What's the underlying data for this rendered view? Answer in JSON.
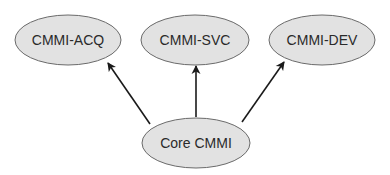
{
  "diagram": {
    "type": "hierarchy",
    "nodes": [
      {
        "id": "acq",
        "label": "CMMI-ACQ",
        "cx": 68,
        "cy": 40,
        "rx": 53,
        "ry": 25
      },
      {
        "id": "svc",
        "label": "CMMI-SVC",
        "cx": 195,
        "cy": 40,
        "rx": 54,
        "ry": 25
      },
      {
        "id": "dev",
        "label": "CMMI-DEV",
        "cx": 322,
        "cy": 40,
        "rx": 53,
        "ry": 25
      },
      {
        "id": "core",
        "label": "Core CMMI",
        "cx": 196,
        "cy": 143,
        "rx": 54,
        "ry": 25
      }
    ],
    "edges": [
      {
        "from": "core",
        "to": "acq",
        "x1": 150,
        "y1": 124,
        "x2": 108,
        "y2": 63
      },
      {
        "from": "core",
        "to": "svc",
        "x1": 196,
        "y1": 117,
        "x2": 196,
        "y2": 66
      },
      {
        "from": "core",
        "to": "dev",
        "x1": 242,
        "y1": 122,
        "x2": 284,
        "y2": 62
      }
    ],
    "colors": {
      "node_fill": "#e2e2e2",
      "node_stroke": "#6a6a6a",
      "edge": "#1a1a1a",
      "text": "#2a2a2a",
      "background": "#ffffff"
    }
  }
}
